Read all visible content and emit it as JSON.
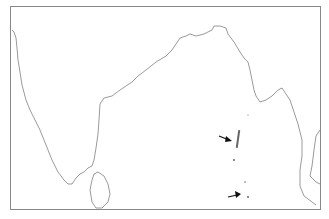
{
  "map": {
    "region": "Indian subcontinent and Bay of Bengal outline",
    "colors": {
      "background": "#ffffff",
      "coastline": "#555555",
      "arrow": "#111111",
      "frame": "#888888"
    },
    "markers": [
      {
        "type": "arrow",
        "label": "",
        "target": "Andaman Islands"
      },
      {
        "type": "arrow",
        "label": "",
        "target": "Nicobar Islands"
      }
    ]
  }
}
